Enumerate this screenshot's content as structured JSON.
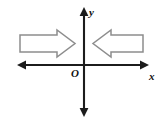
{
  "figure": {
    "name": "coordinate-axes-with-opposing-block-arrows",
    "background_color": "#ffffff",
    "width": 162,
    "height": 126
  },
  "axes": {
    "color": "#1c1c1c",
    "origin_label": "O",
    "x_axis": {
      "label": "x",
      "label_x": 152,
      "label_y": 77,
      "start_x": 17,
      "end_x": 149,
      "y": 65,
      "arrowheads": "both"
    },
    "y_axis": {
      "label": "y",
      "label_x": 90,
      "label_y": 13,
      "x": 84,
      "start_y": 7,
      "end_y": 117,
      "arrowheads": "both"
    },
    "origin": {
      "x": 84,
      "y": 65,
      "label_x": 72,
      "label_y": 76
    }
  },
  "block_arrows": {
    "outline_color": "#8d8d8d",
    "fill_color": "#ffffff",
    "items": [
      {
        "name": "left-block-arrow-pointing-right",
        "direction": "right",
        "quadrant": "left-of-y-axis",
        "shaft_left": 20,
        "shaft_right": 57,
        "shaft_top": 35,
        "shaft_bottom": 52,
        "head_top": 30,
        "head_bottom": 57,
        "tip_x": 75,
        "tip_y": 43.5
      },
      {
        "name": "right-block-arrow-pointing-left",
        "direction": "left",
        "quadrant": "right-of-y-axis",
        "shaft_left": 111,
        "shaft_right": 143,
        "shaft_top": 35,
        "shaft_bottom": 52,
        "head_top": 30,
        "head_bottom": 57,
        "tip_x": 93,
        "tip_y": 43.5
      }
    ]
  }
}
